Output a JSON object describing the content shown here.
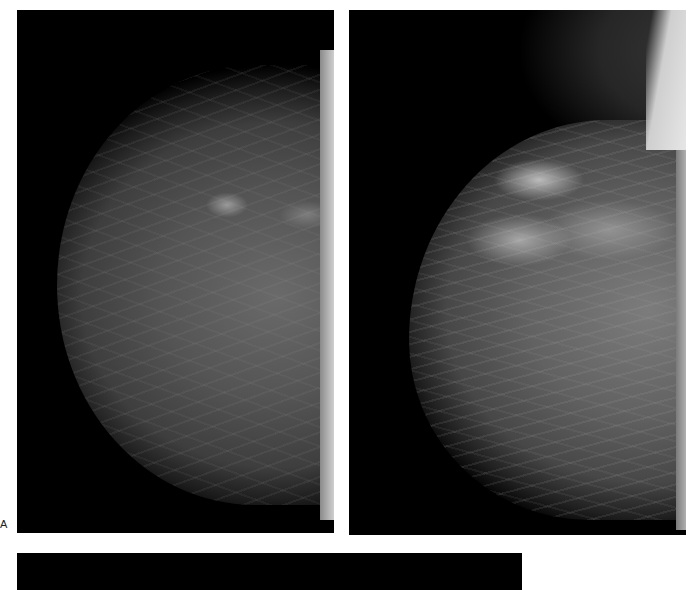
{
  "figure": {
    "panel_label": "A",
    "panels": [
      {
        "name": "left-mammogram",
        "description": "Mammogram, breast tissue with scattered fibroglandular density"
      },
      {
        "name": "right-mammogram",
        "description": "Mammogram, breast tissue with denser upper-outer opacity"
      },
      {
        "name": "bottom-panel",
        "description": "Partially visible black image panel"
      }
    ]
  }
}
